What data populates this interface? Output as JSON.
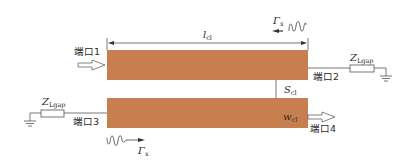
{
  "diagram": {
    "strip_color": "#c87f4f",
    "line_color": "#555555",
    "ports": {
      "port1": "端口1",
      "port2": "端口2",
      "port3": "端口3",
      "port4": "端口4"
    },
    "labels": {
      "length_main": "l",
      "length_sub": "cl",
      "spacing_main": "S",
      "spacing_sub": "cl",
      "width_main": "w",
      "width_sub": "cl",
      "impedance_left_main": "Z",
      "impedance_left_sub": "Lgap",
      "impedance_right_main": "Z",
      "impedance_right_sub": "Lgap",
      "wave_top_main": "Γ",
      "wave_top_sub": "x",
      "wave_bottom_main": "Γ",
      "wave_bottom_sub": "x"
    }
  }
}
